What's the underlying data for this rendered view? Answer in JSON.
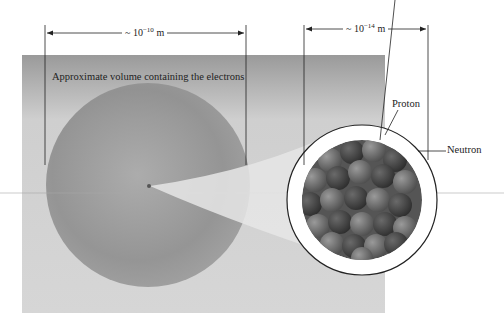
{
  "figure": {
    "dimensions": {
      "atom": {
        "prefix": "~ 10",
        "exponent": "−10",
        "unit": " m"
      },
      "nucleus": {
        "prefix": "~ 10",
        "exponent": "−14",
        "unit": " m"
      }
    },
    "labels": {
      "electron_volume": "Approximate volume containing the electrons",
      "proton": "Proton",
      "neutron": "Neutron"
    },
    "colors": {
      "panel": "#b8b8b8",
      "sphere": "#8c8c8c",
      "proton": "#6e6e6e",
      "neutron": "#4a4a4a",
      "line": "#222222"
    }
  }
}
